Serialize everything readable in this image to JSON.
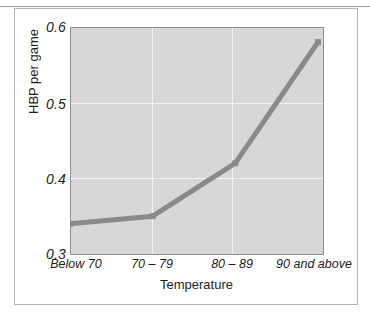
{
  "figure": {
    "background_color": "#ffffff",
    "frame_color": "#b4b4b4"
  },
  "chart_data": {
    "type": "line",
    "title": "",
    "subtitle": "",
    "xlabel": "Temperature",
    "ylabel": "HBP per game",
    "categories": [
      "Below 70",
      "70 – 79",
      "80 – 89",
      "90 and above"
    ],
    "values": [
      0.34,
      0.35,
      0.42,
      0.58
    ],
    "series": [
      {
        "name": "HBP per game",
        "values": [
          0.34,
          0.35,
          0.42,
          0.58
        ]
      }
    ],
    "ylim": [
      0.3,
      0.6
    ],
    "yticks": [
      "0.3",
      "0.4",
      "0.5",
      "0.6"
    ],
    "ytick_values": [
      0.3,
      0.4,
      0.5,
      0.6
    ],
    "xticks": [
      "Below 70",
      "70 – 79",
      "80 – 89",
      "90 and above"
    ],
    "grid": true,
    "grid_color": "#f3f3f3",
    "legend": false,
    "legend_position": "none",
    "plot_background_color": "#d7d7d7",
    "line_color": "#8a8a8a",
    "marker": "square",
    "marker_color": "#8a8a8a",
    "annotations": []
  }
}
